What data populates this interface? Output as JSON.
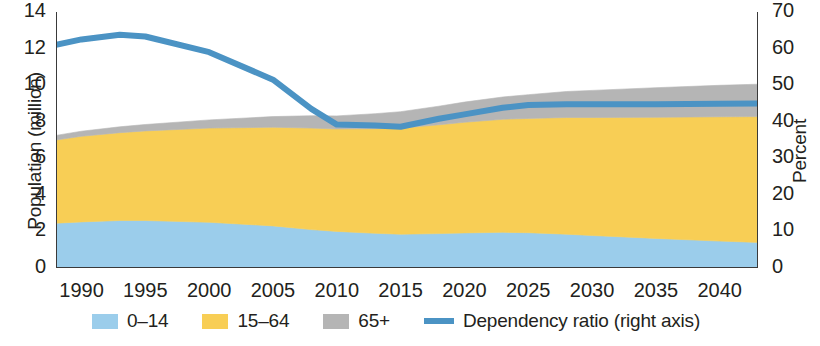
{
  "chart_data": {
    "type": "area",
    "title": "",
    "subtitle": "",
    "xlabel": "",
    "ylabel": "Population (million)",
    "ylabel_right": "Percent",
    "xlim": [
      1988,
      2043
    ],
    "ylim": [
      0,
      14
    ],
    "ylim_right": [
      0,
      70
    ],
    "grid": false,
    "legend_position": "bottom",
    "x_ticks": [
      1990,
      1995,
      2000,
      2005,
      2010,
      2015,
      2020,
      2025,
      2030,
      2035,
      2040
    ],
    "y_ticks_left": [
      0,
      2,
      4,
      6,
      8,
      10,
      12,
      14
    ],
    "y_ticks_right": [
      0,
      10,
      20,
      30,
      40,
      50,
      60,
      70
    ],
    "x": [
      1988,
      1990,
      1993,
      1995,
      2000,
      2005,
      2008,
      2010,
      2013,
      2015,
      2018,
      2020,
      2023,
      2025,
      2028,
      2030,
      2035,
      2040,
      2043
    ],
    "series": [
      {
        "name": "0–14",
        "type": "stacked-area",
        "axis": "left",
        "color": "#9BCDEB",
        "values": [
          2.45,
          2.52,
          2.6,
          2.6,
          2.5,
          2.3,
          2.1,
          2.0,
          1.9,
          1.85,
          1.88,
          1.92,
          1.95,
          1.93,
          1.85,
          1.78,
          1.62,
          1.47,
          1.4
        ]
      },
      {
        "name": "15–64",
        "type": "stacked-area",
        "axis": "left",
        "color": "#F8CE55",
        "values": [
          4.55,
          4.68,
          4.8,
          4.9,
          5.15,
          5.4,
          5.55,
          5.6,
          5.72,
          5.8,
          5.95,
          6.05,
          6.18,
          6.25,
          6.38,
          6.45,
          6.62,
          6.8,
          6.88
        ]
      },
      {
        "name": "65+",
        "type": "stacked-area",
        "axis": "left",
        "color": "#B5B5B5",
        "values": [
          0.25,
          0.28,
          0.32,
          0.35,
          0.45,
          0.58,
          0.68,
          0.72,
          0.82,
          0.9,
          1.02,
          1.1,
          1.22,
          1.3,
          1.42,
          1.48,
          1.62,
          1.72,
          1.77
        ]
      },
      {
        "name": "Dependency ratio (right axis)",
        "type": "line",
        "axis": "right",
        "color": "#4B93C4",
        "values": [
          61.0,
          62.5,
          63.8,
          63.3,
          59.0,
          51.5,
          43.5,
          39.2,
          39.0,
          38.6,
          40.8,
          42.0,
          43.8,
          44.6,
          44.8,
          44.8,
          44.8,
          44.9,
          45.0
        ]
      }
    ]
  },
  "axes": {
    "left": {
      "title": "Population (million)",
      "ticks": [
        "0",
        "2",
        "4",
        "6",
        "8",
        "10",
        "12",
        "14"
      ]
    },
    "right": {
      "title": "Percent",
      "ticks": [
        "0",
        "10",
        "20",
        "30",
        "40",
        "50",
        "60",
        "70"
      ]
    },
    "bottom": {
      "ticks": [
        "1990",
        "1995",
        "2000",
        "2005",
        "2010",
        "2015",
        "2020",
        "2025",
        "2030",
        "2035",
        "2040"
      ]
    }
  },
  "legend": {
    "items": [
      {
        "label": "0–14",
        "color": "#9BCDEB",
        "marker": "swatch"
      },
      {
        "label": "15–64",
        "color": "#F8CE55",
        "marker": "swatch"
      },
      {
        "label": "65+",
        "color": "#B5B5B5",
        "marker": "swatch"
      },
      {
        "label": "Dependency ratio (right axis)",
        "color": "#4B93C4",
        "marker": "line"
      }
    ]
  },
  "colors": {
    "children": "#9BCDEB",
    "working_age": "#F8CE55",
    "elderly": "#B5B5B5",
    "dependency_line": "#4B93C4",
    "axis": "#3a3a3a",
    "text": "#231f20"
  }
}
